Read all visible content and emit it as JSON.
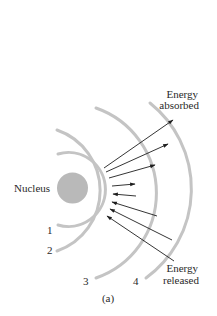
{
  "diagram": {
    "nucleus_label": "Nucleus",
    "shell_labels": [
      "1",
      "2",
      "3",
      "4"
    ],
    "absorbed_label_line1": "Energy",
    "absorbed_label_line2": "absorbed",
    "released_label_line1": "Energy",
    "released_label_line2": "released",
    "caption": "(a)",
    "colors": {
      "nucleus": "#b9b9b9",
      "shell": "#c4c4c4",
      "arrow": "#1e1e1e",
      "text": "#2a2a2a"
    }
  }
}
